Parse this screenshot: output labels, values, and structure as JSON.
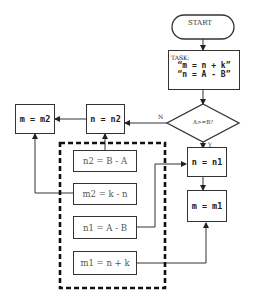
{
  "start": {
    "label": "START"
  },
  "task": {
    "title": "TASK:",
    "line1": "“m = n + k”",
    "line2": "“n = A - B”"
  },
  "decision": {
    "label": "A>=B?",
    "yes_label": "Y",
    "no_label": "N"
  },
  "boxes": {
    "n_eq_n1": "n = n1",
    "m_eq_m1": "m = m1",
    "n_eq_n2": "n = n2",
    "m_eq_m2": "m = m2"
  },
  "inner_blocks": [
    {
      "label": "n2 = B - A"
    },
    {
      "label": "m2 = k - n"
    },
    {
      "label": "n1 = A - B"
    },
    {
      "label": "m1 = n + k"
    }
  ]
}
